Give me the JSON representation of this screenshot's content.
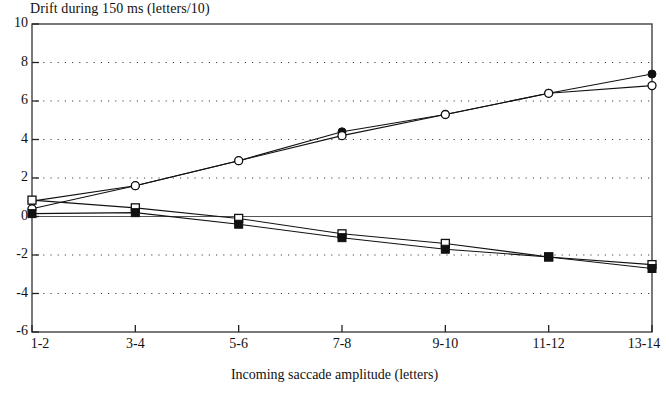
{
  "chart_data": {
    "type": "line",
    "title": "Drift during 150 ms (letters/10)",
    "xlabel": "Incoming saccade amplitude (letters)",
    "ylabel": "",
    "categories": [
      "1-2",
      "3-4",
      "5-6",
      "7-8",
      "9-10",
      "11-12",
      "13-14"
    ],
    "ylim": [
      -6,
      10
    ],
    "yticks": [
      10,
      8,
      6,
      4,
      2,
      0,
      -2,
      -4,
      -6
    ],
    "grid": true,
    "grid_style": "dotted-horizontal",
    "legend": "none",
    "zero_line": true,
    "series": [
      {
        "name": "rightward-filled-circle",
        "marker": "filled-circle",
        "values": [
          0.8,
          1.6,
          2.9,
          4.4,
          5.3,
          6.4,
          7.4
        ]
      },
      {
        "name": "rightward-open-circle",
        "marker": "open-circle",
        "values": [
          0.4,
          1.6,
          2.9,
          4.2,
          5.3,
          6.4,
          6.8
        ]
      },
      {
        "name": "leftward-open-square",
        "marker": "open-square",
        "values": [
          0.85,
          0.45,
          -0.1,
          -0.9,
          -1.4,
          -2.1,
          -2.5
        ]
      },
      {
        "name": "leftward-filled-square",
        "marker": "filled-square",
        "values": [
          0.15,
          0.2,
          -0.4,
          -1.1,
          -1.7,
          -2.1,
          -2.7
        ]
      }
    ]
  },
  "figure": {
    "caption_partial": "clipped text row"
  }
}
